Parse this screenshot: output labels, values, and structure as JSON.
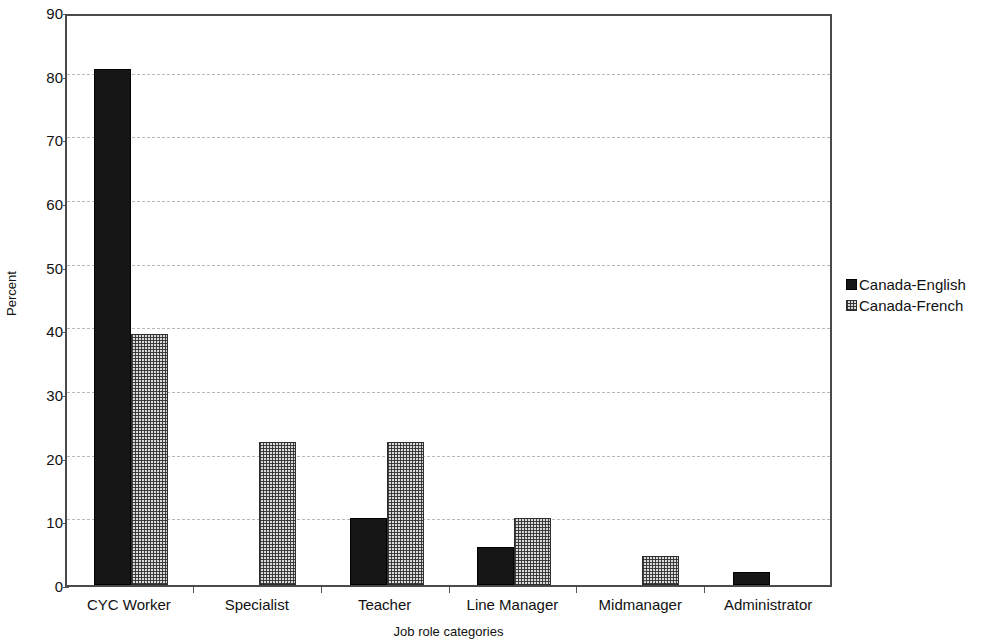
{
  "chart_data": {
    "type": "bar",
    "title": "",
    "xlabel": "Job role categories",
    "ylabel": "Percent",
    "categories": [
      "CYC Worker",
      "Specialist",
      "Teacher",
      "Line Manager",
      "Midmanager",
      "Administrator"
    ],
    "series": [
      {
        "name": "Canada-English",
        "values": [
          81,
          0,
          10.5,
          6,
          0,
          2
        ],
        "fill": "solid-black",
        "color": "#161616"
      },
      {
        "name": "Canada-French",
        "values": [
          39.5,
          22.5,
          22.5,
          10.5,
          4.5,
          0
        ],
        "fill": "dotted-grey",
        "color": "#d9d9d9"
      }
    ],
    "ylim": [
      0,
      90
    ],
    "yticks": [
      0,
      10,
      20,
      30,
      40,
      50,
      60,
      70,
      80,
      90
    ],
    "ytick_labels": [
      "0",
      "10",
      "20",
      "30",
      "40",
      "50",
      "60",
      "70",
      "80",
      "90"
    ],
    "grid": true,
    "grid_axis": "y",
    "legend": [
      "Canada-English",
      "Canada-French"
    ],
    "legend_position": "right"
  },
  "legend": {
    "items": [
      {
        "label": "Canada-English",
        "swatch": "solid-black-swatch"
      },
      {
        "label": "Canada-French",
        "swatch": "dotted-grey-swatch"
      }
    ]
  },
  "axes": {
    "y_title": "Percent",
    "x_title": "Job role categories"
  }
}
